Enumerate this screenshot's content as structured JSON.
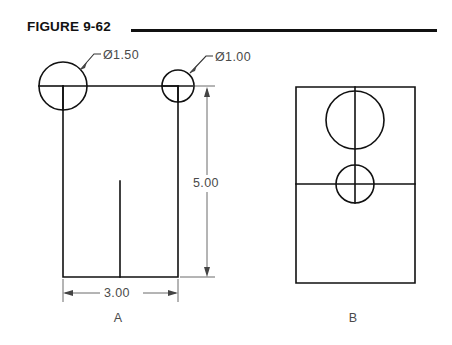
{
  "figure": {
    "title": "FIGURE 9-62"
  },
  "views": [
    {
      "id": "A",
      "label": "A",
      "label_x": 118,
      "label_y": 322
    },
    {
      "id": "B",
      "label": "B",
      "label_x": 353,
      "label_y": 322
    }
  ],
  "callouts": [
    {
      "name": "diameter-1-50",
      "text": "Ø1.50",
      "x": 103,
      "y": 59
    },
    {
      "name": "diameter-1-00",
      "text": "Ø1.00",
      "x": 215,
      "y": 61
    }
  ],
  "dimensions": [
    {
      "name": "height-dimension",
      "text": "5.00",
      "x": 214,
      "y": 187,
      "value": 5.0,
      "orientation": "vertical"
    },
    {
      "name": "width-dimension",
      "text": "3.00",
      "x": 104,
      "y": 297,
      "value": 3.0,
      "orientation": "horizontal"
    }
  ],
  "colors": {
    "object_line": "#111111",
    "thin_line": "#5a5a5a",
    "text": "#4a4a4a",
    "background": "#ffffff"
  }
}
